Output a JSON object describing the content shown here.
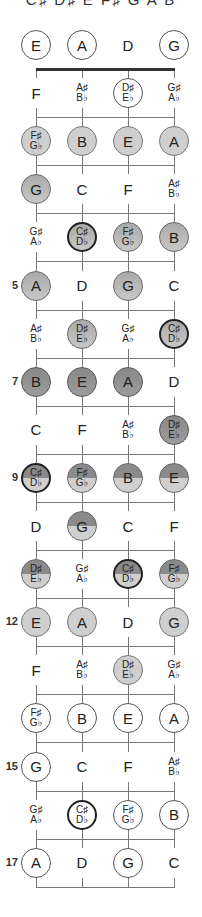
{
  "title": "C♯ D♯ E F♯ G A B",
  "strings": [
    "E",
    "A",
    "D",
    "G"
  ],
  "layout": {
    "string_x": [
      36,
      82,
      128,
      174
    ],
    "open_y": 45,
    "nut_y": 69,
    "fret_spacing": 48.1,
    "frets": 17
  },
  "colors": {
    "string": "#777777",
    "nut": "#333333",
    "light": "#cfcfcf",
    "dark": "#888888"
  },
  "fret_markers": [
    {
      "fret": 5,
      "label": "5"
    },
    {
      "fret": 7,
      "label": "7"
    },
    {
      "fret": 9,
      "label": "9"
    },
    {
      "fret": 12,
      "label": "12"
    },
    {
      "fret": 15,
      "label": "15"
    },
    {
      "fret": 17,
      "label": "17"
    }
  ],
  "rows": [
    {
      "fret": 0,
      "notes": [
        {
          "t": [
            "E"
          ],
          "s": "outline"
        },
        {
          "t": [
            "A"
          ],
          "s": "outline"
        },
        {
          "t": [
            "D"
          ],
          "s": "plain"
        },
        {
          "t": [
            "G"
          ],
          "s": "outline"
        }
      ]
    },
    {
      "fret": 1,
      "notes": [
        {
          "t": [
            "F"
          ],
          "s": "plain"
        },
        {
          "t": [
            "A♯",
            "B♭"
          ],
          "s": "plain"
        },
        {
          "t": [
            "D♯",
            "E♭"
          ],
          "s": "outline"
        },
        {
          "t": [
            "G♯",
            "A♭"
          ],
          "s": "plain"
        }
      ]
    },
    {
      "fret": 2,
      "notes": [
        {
          "t": [
            "F♯",
            "G♭"
          ],
          "s": "light"
        },
        {
          "t": [
            "B"
          ],
          "s": "light"
        },
        {
          "t": [
            "E"
          ],
          "s": "light"
        },
        {
          "t": [
            "A"
          ],
          "s": "light"
        }
      ]
    },
    {
      "fret": 3,
      "notes": [
        {
          "t": [
            "G"
          ],
          "s": "mid"
        },
        {
          "t": [
            "C"
          ],
          "s": "plain"
        },
        {
          "t": [
            "F"
          ],
          "s": "plain"
        },
        {
          "t": [
            "A♯",
            "B♭"
          ],
          "s": "plain"
        }
      ]
    },
    {
      "fret": 4,
      "notes": [
        {
          "t": [
            "G♯",
            "A♭"
          ],
          "s": "plain"
        },
        {
          "t": [
            "C♯",
            "D♭"
          ],
          "s": "mid root"
        },
        {
          "t": [
            "F♯",
            "G♭"
          ],
          "s": "mid"
        },
        {
          "t": [
            "B"
          ],
          "s": "mid"
        }
      ]
    },
    {
      "fret": 5,
      "notes": [
        {
          "t": [
            "A"
          ],
          "s": "mid"
        },
        {
          "t": [
            "D"
          ],
          "s": "plain"
        },
        {
          "t": [
            "G"
          ],
          "s": "mid"
        },
        {
          "t": [
            "C"
          ],
          "s": "plain"
        }
      ]
    },
    {
      "fret": 6,
      "notes": [
        {
          "t": [
            "A♯",
            "B♭"
          ],
          "s": "plain"
        },
        {
          "t": [
            "D♯",
            "E♭"
          ],
          "s": "mid"
        },
        {
          "t": [
            "G♯",
            "A♭"
          ],
          "s": "plain"
        },
        {
          "t": [
            "C♯",
            "D♭"
          ],
          "s": "mid root"
        }
      ]
    },
    {
      "fret": 7,
      "notes": [
        {
          "t": [
            "B"
          ],
          "s": "dark"
        },
        {
          "t": [
            "E"
          ],
          "s": "dark"
        },
        {
          "t": [
            "A"
          ],
          "s": "dark"
        },
        {
          "t": [
            "D"
          ],
          "s": "plain"
        }
      ]
    },
    {
      "fret": 8,
      "notes": [
        {
          "t": [
            "C"
          ],
          "s": "plain"
        },
        {
          "t": [
            "F"
          ],
          "s": "plain"
        },
        {
          "t": [
            "A♯",
            "B♭"
          ],
          "s": "plain"
        },
        {
          "t": [
            "D♯",
            "E♭"
          ],
          "s": "dark"
        }
      ]
    },
    {
      "fret": 9,
      "notes": [
        {
          "t": [
            "C♯",
            "D♭"
          ],
          "s": "split root"
        },
        {
          "t": [
            "F♯",
            "G♭"
          ],
          "s": "split"
        },
        {
          "t": [
            "B"
          ],
          "s": "split"
        },
        {
          "t": [
            "E"
          ],
          "s": "split"
        }
      ]
    },
    {
      "fret": 10,
      "notes": [
        {
          "t": [
            "D"
          ],
          "s": "plain"
        },
        {
          "t": [
            "G"
          ],
          "s": "split"
        },
        {
          "t": [
            "C"
          ],
          "s": "plain"
        },
        {
          "t": [
            "F"
          ],
          "s": "plain"
        }
      ]
    },
    {
      "fret": 11,
      "notes": [
        {
          "t": [
            "D♯",
            "E♭"
          ],
          "s": "split"
        },
        {
          "t": [
            "G♯",
            "A♭"
          ],
          "s": "plain"
        },
        {
          "t": [
            "C♯",
            "D♭"
          ],
          "s": "split root"
        },
        {
          "t": [
            "F♯",
            "G♭"
          ],
          "s": "split"
        }
      ]
    },
    {
      "fret": 12,
      "notes": [
        {
          "t": [
            "E"
          ],
          "s": "light"
        },
        {
          "t": [
            "A"
          ],
          "s": "light"
        },
        {
          "t": [
            "D"
          ],
          "s": "plain"
        },
        {
          "t": [
            "G"
          ],
          "s": "light"
        }
      ]
    },
    {
      "fret": 13,
      "notes": [
        {
          "t": [
            "F"
          ],
          "s": "plain"
        },
        {
          "t": [
            "A♯",
            "B♭"
          ],
          "s": "plain"
        },
        {
          "t": [
            "D♯",
            "E♭"
          ],
          "s": "light"
        },
        {
          "t": [
            "G♯",
            "A♭"
          ],
          "s": "plain"
        }
      ]
    },
    {
      "fret": 14,
      "notes": [
        {
          "t": [
            "F♯",
            "G♭"
          ],
          "s": "outline"
        },
        {
          "t": [
            "B"
          ],
          "s": "outline"
        },
        {
          "t": [
            "E"
          ],
          "s": "outline"
        },
        {
          "t": [
            "A"
          ],
          "s": "outline"
        }
      ]
    },
    {
      "fret": 15,
      "notes": [
        {
          "t": [
            "G"
          ],
          "s": "outline"
        },
        {
          "t": [
            "C"
          ],
          "s": "plain"
        },
        {
          "t": [
            "F"
          ],
          "s": "plain"
        },
        {
          "t": [
            "A♯",
            "B♭"
          ],
          "s": "plain"
        }
      ]
    },
    {
      "fret": 16,
      "notes": [
        {
          "t": [
            "G♯",
            "A♭"
          ],
          "s": "plain"
        },
        {
          "t": [
            "C♯",
            "D♭"
          ],
          "s": "outline root"
        },
        {
          "t": [
            "F♯",
            "G♭"
          ],
          "s": "outline"
        },
        {
          "t": [
            "B"
          ],
          "s": "outline"
        }
      ]
    },
    {
      "fret": 17,
      "notes": [
        {
          "t": [
            "A"
          ],
          "s": "outline"
        },
        {
          "t": [
            "D"
          ],
          "s": "plain"
        },
        {
          "t": [
            "G"
          ],
          "s": "outline"
        },
        {
          "t": [
            "C"
          ],
          "s": "plain"
        }
      ]
    }
  ]
}
